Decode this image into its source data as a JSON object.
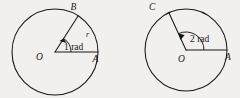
{
  "figure": {
    "background_color": "#f2f0ee",
    "ink_color": "#17161a",
    "panels": [
      {
        "id": "left-circle",
        "center_label": "O",
        "terminal_point_label": "B",
        "initial_point_label": "A",
        "radius_label": "r",
        "angle_label": "1 rad",
        "angle_radians": 1,
        "center_x": 55,
        "center_y": 52,
        "radius": 43
      },
      {
        "id": "right-circle",
        "center_label": "O",
        "terminal_point_label": "C",
        "initial_point_label": "A",
        "radius_label": "",
        "angle_label": "2 rad",
        "angle_radians": 2,
        "center_x": 186,
        "center_y": 50,
        "radius": 41
      }
    ]
  }
}
